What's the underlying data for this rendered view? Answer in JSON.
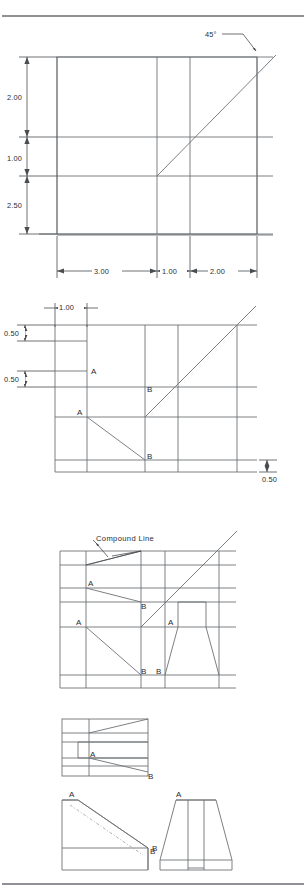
{
  "page": {
    "background_color": "#ffffff",
    "line_color": "#6e7275",
    "dimension_color": "#4a4d50",
    "text_color": "#2b2d2f",
    "width": 306,
    "height": 893
  },
  "rules": {
    "top_rule": "horizontal-rule-top",
    "bottom_rule": "horizontal-rule-bottom"
  },
  "figure1": {
    "name": "top-view-layout",
    "angle_label": "45°",
    "vertical_dimensions": [
      "2.00",
      "1.00",
      "2.50"
    ],
    "horizontal_dimensions": [
      "3.00",
      "1.00",
      "2.00"
    ]
  },
  "figure2": {
    "name": "front-view-layout",
    "horizontal_dimensions": [
      "1.00"
    ],
    "vertical_dimensions": [
      "0.50",
      "0.50"
    ],
    "right_dimension": "0.50",
    "point_labels": [
      "A",
      "B",
      "A",
      "B"
    ]
  },
  "figure3": {
    "name": "compound-line-view",
    "note": "Compound Line",
    "point_labels": [
      "A",
      "B",
      "A",
      "A",
      "B",
      "B"
    ]
  },
  "figure4": {
    "name": "side-view-slot",
    "point_labels": [
      "A",
      "B"
    ]
  },
  "figure5": {
    "name": "pictorial-side-elevation",
    "point_labels": [
      "A",
      "B"
    ]
  },
  "figure6": {
    "name": "pictorial-front-elevation",
    "point_labels": [
      "A",
      "B"
    ]
  }
}
